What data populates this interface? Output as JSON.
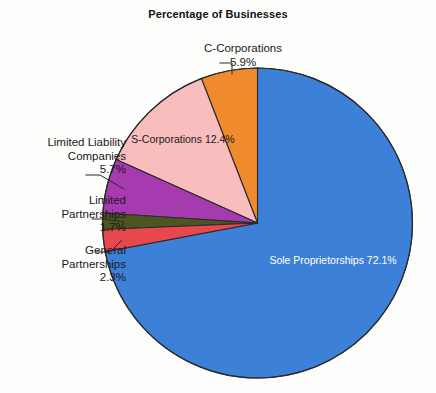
{
  "chart_data": {
    "type": "pie",
    "title": "Percentage of Businesses",
    "xlabel": "",
    "ylabel": "",
    "legend_position": "none",
    "grid": false,
    "units": "percent",
    "categories": [
      "Sole Proprietorships",
      "C-Corporations",
      "S-Corporations",
      "Limited Liability Companies",
      "Limited Partnerships",
      "General Partnerships"
    ],
    "values": [
      72.1,
      5.9,
      12.4,
      5.7,
      1.7,
      2.3
    ],
    "slices": [
      {
        "label": "Sole Proprietorships",
        "value": 72.1,
        "value_text": "72.1%",
        "color": "#3d80d8",
        "label_placement": "inside",
        "label_color": "#ffffff"
      },
      {
        "label": "C-Corporations",
        "value": 5.9,
        "value_text": "5.9%",
        "color": "#ef8b2c",
        "label_placement": "outside-top",
        "label_color": "#1a1a1a"
      },
      {
        "label": "S-Corporations",
        "value": 12.4,
        "value_text": "12.4%",
        "color": "#f9bdbd",
        "label_placement": "inside",
        "label_color": "#1a1a1a"
      },
      {
        "label": "Limited Liability Companies",
        "value": 5.7,
        "value_text": "5.7%",
        "color": "#a63bb0",
        "label_placement": "outside-left",
        "label_color": "#1a1a1a"
      },
      {
        "label": "Limited Partnerships",
        "value": 1.7,
        "value_text": "1.7%",
        "color": "#4d5520",
        "label_placement": "outside-left",
        "label_color": "#1a1a1a"
      },
      {
        "label": "General Partnerships",
        "value": 2.3,
        "value_text": "2.3%",
        "color": "#e8474d",
        "label_placement": "outside-left",
        "label_color": "#1a1a1a"
      }
    ]
  },
  "labels": {
    "c_corporations": {
      "name": "C-Corporations",
      "pct": "5.9%"
    },
    "s_corporations": {
      "name": "S-Corporations",
      "pct": "12.4%"
    },
    "sole_proprietorships": {
      "name": "Sole Proprietorships",
      "pct": "72.1%"
    },
    "limited_liability": {
      "line1": "Limited Liability",
      "line2": "Companies",
      "pct": "5.7%"
    },
    "limited_partnerships": {
      "line1": "Limited",
      "line2": "Partnerships",
      "pct": "1.7%"
    },
    "general_partnerships": {
      "line1": "General",
      "line2": "Partnerships",
      "pct": "2.3%"
    }
  },
  "style": {
    "background": "#fdfdfb",
    "slice_outline": "#2b2b2b",
    "leader_line": "#2b2b2b"
  }
}
